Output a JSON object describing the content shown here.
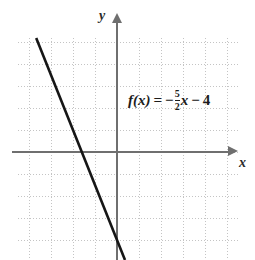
{
  "chart_data": {
    "type": "line",
    "title": "",
    "xlabel": "x",
    "ylabel": "y",
    "equation_text": "f(x) = -5/2 x - 4",
    "slope": -2.5,
    "intercept": -4,
    "xlim": [
      -4.5,
      5.5
    ],
    "ylim": [
      -5,
      5.2
    ],
    "grid": true,
    "grid_style": "dotted",
    "grid_step": 1,
    "legend": "none",
    "series": [
      {
        "name": "f(x)",
        "points": [
          {
            "x": -3.3,
            "y": 4.25
          },
          {
            "x": 0,
            "y": -4
          },
          {
            "x": 0.6,
            "y": -5.5
          }
        ]
      }
    ],
    "annotations": [
      {
        "text": "f(x) = -5/2 x - 4",
        "x": 0.5,
        "y": 2.8
      }
    ]
  },
  "equation": {
    "fn": "f(x)",
    "equals": "=",
    "sign": "−",
    "numerator": "5",
    "denominator": "2",
    "variable": "x",
    "operator": "−",
    "constant": "4"
  },
  "axes": {
    "y_label": "y",
    "x_label": "x"
  },
  "icons": {
    "y_arrow": "arrow-up-icon",
    "x_arrow": "arrow-right-icon"
  }
}
